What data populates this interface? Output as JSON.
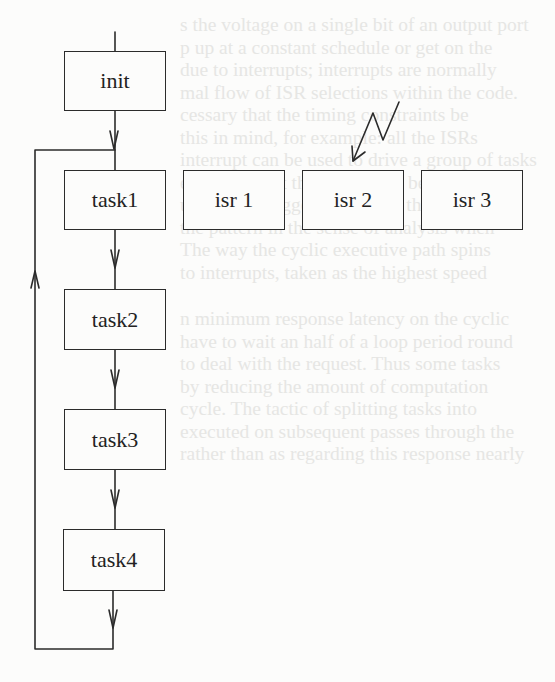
{
  "diagram": {
    "title": "",
    "nodes": {
      "init": "init",
      "task1": "task1",
      "task2": "task2",
      "task3": "task3",
      "task4": "task4",
      "isr1": "isr 1",
      "isr2": "isr 2",
      "isr3": "isr 3"
    },
    "edges": [
      {
        "from": "entry",
        "to": "init"
      },
      {
        "from": "init",
        "to": "task1"
      },
      {
        "from": "task1",
        "to": "task2"
      },
      {
        "from": "task2",
        "to": "task3"
      },
      {
        "from": "task3",
        "to": "task4"
      },
      {
        "from": "task4",
        "to": "task1",
        "type": "loop-back"
      },
      {
        "from": "interrupt",
        "to": "isr2",
        "type": "lightning"
      }
    ],
    "colors": {
      "line": "#2b2b2b",
      "background": "#fcfcfb",
      "bleed_through_text": "#e6e6e4"
    }
  },
  "background_text": {
    "lines": [
      "",
      "s the voltage on a single bit of an output port",
      "p up at a constant schedule or get on the",
      "due to interrupts; interrupts are normally",
      "mal flow of ISR selections within the code.",
      "cessary that the timing constraints be",
      "this in mind, for example: all the ISRs",
      "interrupt can be used to drive a group of tasks",
      "each task, but this will never be satisfactory",
      "ultimately triggered, beyond the possible",
      "the pattern in the sense of analysis when",
      "The way the cyclic executive path spins",
      "to interrupts, taken as the highest speed"
    ],
    "lines2": [
      "n minimum response latency on the cyclic",
      "have to wait an half of a loop period round",
      "to deal with the request. Thus some tasks",
      "by reducing the amount of computation",
      "cycle. The tactic of splitting tasks into",
      "executed on subsequent passes through the",
      "rather than as regarding this response nearly"
    ]
  }
}
